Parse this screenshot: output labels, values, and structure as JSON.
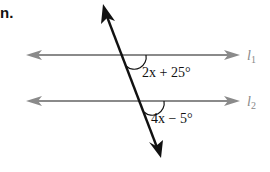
{
  "problem": {
    "number": "n."
  },
  "diagram": {
    "lines": [
      {
        "name": "l",
        "subscript": "1",
        "y": 55
      },
      {
        "name": "l",
        "subscript": "2",
        "y": 101
      }
    ],
    "angles": [
      {
        "label": "2x + 25°",
        "line": "l1"
      },
      {
        "label": "4x − 5°",
        "line": "l2"
      }
    ],
    "colors": {
      "parallel_lines": "#8a8a8a",
      "transversal": "#111111",
      "text": "#111111",
      "line_labels": "#8a8a8a"
    }
  }
}
